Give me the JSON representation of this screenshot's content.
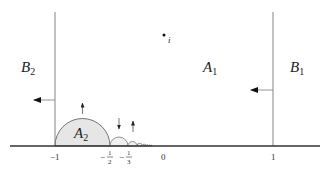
{
  "diagram": {
    "title": "",
    "regions": {
      "A1": {
        "letter": "A",
        "sub": "1"
      },
      "A2": {
        "letter": "A",
        "sub": "2"
      },
      "B1": {
        "letter": "B",
        "sub": "1"
      },
      "B2": {
        "letter": "B",
        "sub": "2"
      }
    },
    "point": {
      "label": "i"
    },
    "ticks": {
      "neg_one": "−1",
      "neg_half_sign": "−",
      "neg_half_num": "1",
      "neg_half_den": "2",
      "neg_third_sign": "−",
      "neg_third_num": "1",
      "neg_third_den": "3",
      "zero": "0",
      "one": "1"
    },
    "colors": {
      "fill_region": "#e6e6e6",
      "line": "#555555",
      "axis": "#333333"
    }
  }
}
